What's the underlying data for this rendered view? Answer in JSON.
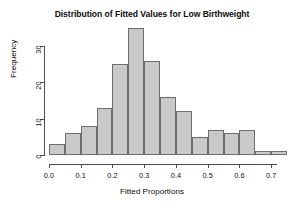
{
  "chart_data": {
    "type": "bar",
    "title": "Distribution of Fitted Values for Low Birthweight",
    "xlabel": "Fitted Proportions",
    "ylabel": "Frequency",
    "bin_width": 0.05,
    "bin_starts": [
      0.0,
      0.05,
      0.1,
      0.15,
      0.2,
      0.25,
      0.3,
      0.35,
      0.4,
      0.45,
      0.5,
      0.55,
      0.6,
      0.65,
      0.7
    ],
    "categories": [
      "0.00-0.05",
      "0.05-0.10",
      "0.10-0.15",
      "0.15-0.20",
      "0.20-0.25",
      "0.25-0.30",
      "0.30-0.35",
      "0.35-0.40",
      "0.40-0.45",
      "0.45-0.50",
      "0.50-0.55",
      "0.55-0.60",
      "0.60-0.65",
      "0.65-0.70",
      "0.70-0.75"
    ],
    "values": [
      3,
      6,
      8,
      13,
      25,
      35,
      26,
      16,
      12,
      5,
      7,
      6,
      7,
      1,
      1
    ],
    "xlim": [
      0.0,
      0.75
    ],
    "ylim": [
      0,
      35
    ],
    "xticks": [
      "0.0",
      "0.1",
      "0.2",
      "0.3",
      "0.4",
      "0.5",
      "0.6",
      "0.7"
    ],
    "xtick_values": [
      0.0,
      0.1,
      0.2,
      0.3,
      0.4,
      0.5,
      0.6,
      0.7
    ],
    "yticks": [
      "0",
      "10",
      "20",
      "30"
    ],
    "ytick_values": [
      0,
      10,
      20,
      30
    ],
    "grid": false,
    "legend": null,
    "bar_fill_color": "#c9c9c9",
    "bar_border_color": "#6e6e6e",
    "axis_color": "#4d4d4d"
  }
}
